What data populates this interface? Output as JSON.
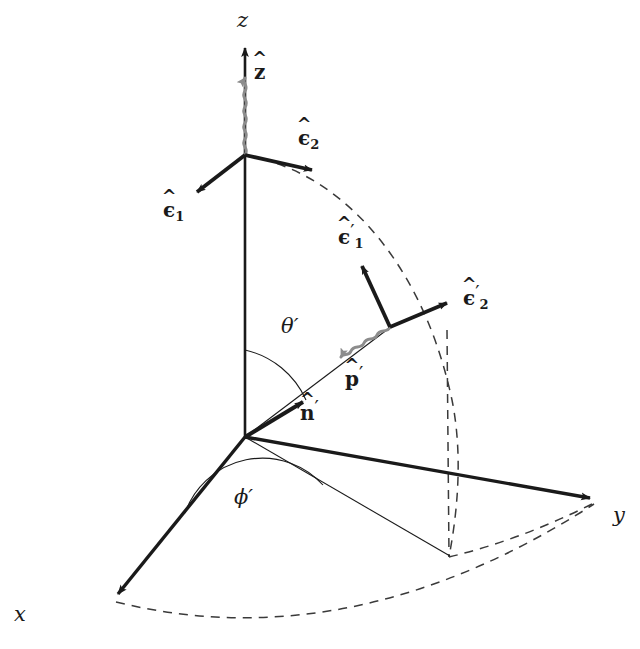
{
  "figure": {
    "background_color": "#ffffff",
    "line_color": "#1a1a1a",
    "photon_color": "#8c8c8c",
    "dash_color": "#3a3a3a"
  },
  "axes": {
    "x": {
      "label": "x",
      "tip": [
        112,
        600
      ],
      "label_pos": [
        60,
        612
      ]
    },
    "y": {
      "label": "y",
      "tip": [
        597,
        501
      ],
      "label_pos": [
        613,
        512
      ]
    },
    "z": {
      "label": "z",
      "tip": [
        245,
        42
      ],
      "label_pos": [
        237,
        14
      ]
    },
    "origin": [
      245,
      437
    ]
  },
  "vectors": {
    "z_hat": {
      "label": "z",
      "hat": "^",
      "bold": true,
      "tip": [
        245,
        75
      ],
      "label_pos": [
        254,
        68
      ],
      "color": "#8c8c8c"
    },
    "eps1": {
      "label": "ϵ",
      "hat": "^",
      "sub": "1",
      "tip": [
        192,
        196
      ],
      "label_pos": [
        168,
        203
      ]
    },
    "eps2": {
      "label": "ϵ",
      "hat": "^",
      "sub": "2",
      "tip": [
        318,
        172
      ],
      "label_pos": [
        300,
        131
      ]
    },
    "eps1p": {
      "label": "ϵ",
      "hat": "^",
      "sub": "1",
      "prime": "′",
      "tip": [
        358,
        261
      ],
      "label_pos": [
        343,
        225
      ]
    },
    "eps2p": {
      "label": "ϵ",
      "hat": "^",
      "sub": "2",
      "prime": "′",
      "tip": [
        452,
        300
      ],
      "label_pos": [
        466,
        287
      ]
    },
    "n_prime": {
      "label": "n",
      "hat": "^",
      "prime": "′",
      "tip": [
        308,
        398
      ],
      "label_pos": [
        302,
        403
      ]
    },
    "p_prime": {
      "label": "p",
      "hat": "^",
      "prime": "′",
      "tip": [
        336,
        363
      ],
      "label_pos": [
        346,
        370
      ],
      "color": "#8c8c8c"
    }
  },
  "angles": {
    "theta_prime": {
      "label": "θ",
      "prime": "′",
      "label_pos": [
        283,
        322
      ],
      "between": [
        "z-axis",
        "n-prime"
      ]
    },
    "phi_prime": {
      "label": "ϕ",
      "prime": "′",
      "label_pos": [
        236,
        494
      ],
      "between": [
        "x-axis",
        "projection"
      ]
    }
  },
  "geometry": {
    "incoming_photon": {
      "from": [
        245,
        155
      ],
      "to": [
        245,
        75
      ],
      "style": "wavy",
      "color": "#8c8c8c"
    },
    "scattered_photon": {
      "from": [
        390,
        327
      ],
      "to": [
        336,
        363
      ],
      "style": "wavy",
      "color": "#8c8c8c"
    },
    "unprimed_vertex": [
      245,
      155
    ],
    "primed_vertex": [
      390,
      327
    ],
    "scatter_ray": {
      "from": [
        245,
        437
      ],
      "to": [
        390,
        327
      ],
      "style": "thin-solid"
    },
    "projection_ray": {
      "from": [
        245,
        437
      ],
      "to": [
        450,
        556
      ],
      "style": "thin-solid"
    },
    "drop_line": {
      "from": [
        448,
        330
      ],
      "to": [
        449,
        557
      ],
      "style": "dashed"
    },
    "meridian_arc": {
      "from": [
        245,
        155
      ],
      "to": [
        449,
        557
      ],
      "style": "dashed"
    },
    "equator_arc": {
      "from": [
        112,
        600
      ],
      "to": [
        597,
        501
      ],
      "style": "dashed"
    }
  }
}
